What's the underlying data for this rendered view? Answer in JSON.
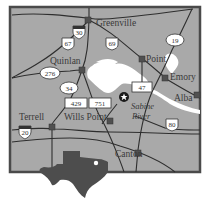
{
  "map": {
    "colors": {
      "land": "#a9a9a9",
      "frame": "#4a4a4a",
      "water": "#ffffff",
      "road": "#2e2e2e",
      "town_marker": "#505050",
      "texas": "#4d4d4d"
    },
    "towns": [
      {
        "name": "Greenville"
      },
      {
        "name": "Quinlan"
      },
      {
        "name": "Point"
      },
      {
        "name": "Emory"
      },
      {
        "name": "Alba"
      },
      {
        "name": "Terrell"
      },
      {
        "name": "Wills Point"
      },
      {
        "name": "Canton"
      }
    ],
    "river_label": {
      "line1": "Sabine",
      "line2": "River"
    },
    "routes": [
      {
        "number": "30",
        "type": "interstate"
      },
      {
        "number": "67",
        "type": "us"
      },
      {
        "number": "69",
        "type": "us"
      },
      {
        "number": "19",
        "type": "state"
      },
      {
        "number": "276",
        "type": "state"
      },
      {
        "number": "34",
        "type": "state"
      },
      {
        "number": "47",
        "type": "farm"
      },
      {
        "number": "429",
        "type": "farm"
      },
      {
        "number": "751",
        "type": "farm"
      },
      {
        "number": "20",
        "type": "interstate"
      },
      {
        "number": "80",
        "type": "us"
      }
    ],
    "star_marker": "star-icon",
    "inset": "texas-silhouette"
  }
}
